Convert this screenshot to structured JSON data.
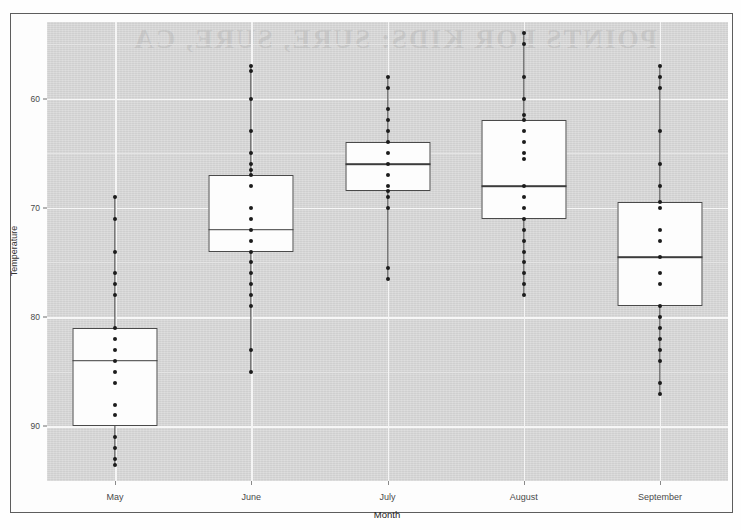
{
  "figure": {
    "watermark_text": "POINTS FOR KIDS: SURE, SURE, CA"
  },
  "axes": {
    "y_title": "Temperature",
    "x_title": "Month",
    "y_ticks": [
      "90",
      "80",
      "70",
      "60"
    ],
    "x_ticks": [
      "May",
      "June",
      "July",
      "August",
      "September"
    ]
  },
  "chart_data": {
    "type": "box",
    "title": "",
    "xlabel": "Month",
    "ylabel": "Temperature",
    "categories": [
      "May",
      "June",
      "July",
      "August",
      "September"
    ],
    "ylim": [
      55,
      97
    ],
    "y_ticks": [
      60,
      70,
      80,
      90
    ],
    "grid": true,
    "legend": "none",
    "overlay": "jittered data points (strip plot) drawn on the category center line",
    "boxes": [
      {
        "category": "May",
        "whisker_low": 56.5,
        "q1": 60,
        "median": 66,
        "q3": 69,
        "whisker_high": 81,
        "points": [
          81,
          79,
          76,
          74,
          73,
          72,
          69,
          68,
          67,
          66,
          65,
          64,
          62,
          61,
          59,
          58,
          57,
          56.5
        ]
      },
      {
        "category": "June",
        "whisker_low": 65,
        "q1": 76,
        "median": 78,
        "q3": 83,
        "whisker_high": 93,
        "points": [
          93,
          92.5,
          90,
          87,
          85,
          84,
          83.5,
          83,
          82,
          80,
          79,
          78,
          77,
          76,
          75,
          74,
          73,
          72,
          71,
          67,
          65
        ]
      },
      {
        "category": "July",
        "whisker_low": 73.5,
        "q1": 81.5,
        "median": 84,
        "q3": 86,
        "whisker_high": 92,
        "points": [
          92,
          91,
          89,
          88,
          87,
          86,
          85,
          84,
          83,
          82,
          81.5,
          81,
          80,
          74.5,
          73.5
        ]
      },
      {
        "category": "August",
        "whisker_low": 72,
        "q1": 79,
        "median": 82,
        "q3": 88,
        "whisker_high": 96,
        "points": [
          96,
          95,
          92,
          90,
          88.5,
          88,
          87,
          86,
          85,
          84.5,
          82,
          81,
          80,
          79,
          78,
          77,
          76,
          75,
          74,
          73,
          72
        ]
      },
      {
        "category": "September",
        "whisker_low": 63,
        "q1": 71,
        "median": 75.5,
        "q3": 80.5,
        "whisker_high": 93,
        "points": [
          93,
          92,
          91,
          87,
          84,
          82,
          80.5,
          80,
          78,
          77,
          75.5,
          74,
          73,
          71,
          70,
          69,
          68,
          67,
          66,
          64,
          63
        ]
      }
    ]
  }
}
